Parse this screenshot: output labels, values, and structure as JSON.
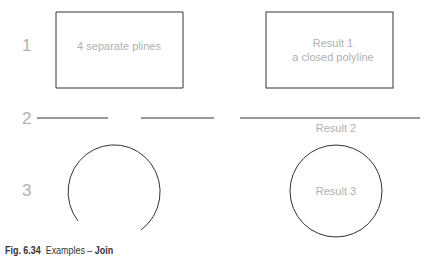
{
  "rows": [
    {
      "number": "1",
      "left_label": "4 separate plines",
      "right_label_line1": "Result 1",
      "right_label_line2": "a closed polyline"
    },
    {
      "number": "2",
      "right_label": "Result 2"
    },
    {
      "number": "3",
      "right_label": "Result 3"
    }
  ],
  "caption": {
    "figure": "Fig. 6.34",
    "text": "Examples –",
    "bold": "Join"
  },
  "colors": {
    "stroke": "#333333",
    "label": "#b0b0b0"
  }
}
